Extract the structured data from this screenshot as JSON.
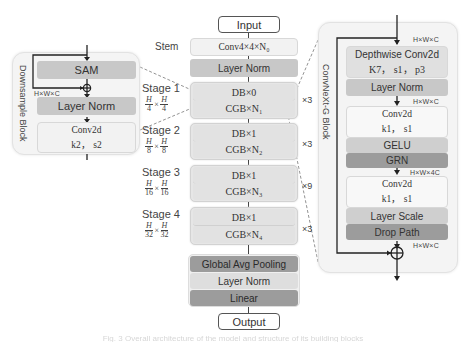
{
  "backbone": {
    "input_label": "Input",
    "stem_label": "Stem",
    "stem_box": "Conv4×4×N₀",
    "layer_norm": "Layer Norm",
    "stages": [
      {
        "label": "Stage 1",
        "res_num": "H",
        "res_den": "4",
        "db": "DB×0",
        "cgb": "CGB×N₁",
        "repeat": "×3"
      },
      {
        "label": "Stage 2",
        "res_num": "H",
        "res_den": "8",
        "db": "DB×1",
        "cgb": "CGB×N₂",
        "repeat": "×3"
      },
      {
        "label": "Stage 3",
        "res_num": "H",
        "res_den": "16",
        "db": "DB×1",
        "cgb": "CGB×N₃",
        "repeat": "×9"
      },
      {
        "label": "Stage 4",
        "res_num": "H",
        "res_den": "32",
        "db": "DB×1",
        "cgb": "CGB×N₄",
        "repeat": "×3"
      }
    ],
    "head": {
      "pool": "Global Avg Pooling",
      "norm": "Layer Norm",
      "linear": "Linear"
    },
    "output_label": "Output"
  },
  "downsample_block": {
    "title": "Downsample Block",
    "sam": "SAM",
    "dim": "H×W×C",
    "norm": "Layer Norm",
    "conv_title": "Conv2d",
    "conv_params": "k2， s2"
  },
  "convnext_block": {
    "title": "ConvNeXt-G Block",
    "dim_in": "H×W×C",
    "dw_title": "Depthwise Conv2d",
    "dw_params": "K7， s1， p3",
    "norm": "Layer Norm",
    "dim_after_norm": "H×W×C",
    "conv1_title": "Conv2d",
    "conv1_params": "k1， s1",
    "gelu": "GELU",
    "grn": "GRN",
    "dim_expand": "H×W×4C",
    "conv2_title": "Conv2d",
    "conv2_params": "k1， s1",
    "layer_scale": "Layer Scale",
    "drop_path": "Drop Path",
    "dim_out": "H×W×C"
  },
  "caption": "Fig. 3  Overall architecture of the model and structure of its building blocks"
}
